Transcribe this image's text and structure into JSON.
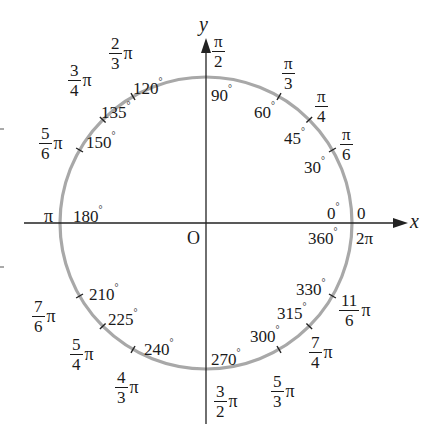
{
  "diagram": {
    "axes": {
      "x_label": "x",
      "y_label": "y",
      "origin_label": "O"
    },
    "colors": {
      "circle": "#a8a8a8",
      "axis": "#222222",
      "text": "#1a1a1a",
      "background": "#ffffff"
    },
    "points": [
      {
        "deg": 0,
        "deg_label": "0",
        "rad_label": "0"
      },
      {
        "deg": 30,
        "deg_label": "30",
        "rad_num": "π",
        "rad_den": "6"
      },
      {
        "deg": 45,
        "deg_label": "45",
        "rad_num": "π",
        "rad_den": "4"
      },
      {
        "deg": 60,
        "deg_label": "60",
        "rad_num": "π",
        "rad_den": "3"
      },
      {
        "deg": 90,
        "deg_label": "90",
        "rad_num": "π",
        "rad_den": "2"
      },
      {
        "deg": 120,
        "deg_label": "120",
        "rad_num": "2",
        "rad_den": "3",
        "rad_suffix": "π"
      },
      {
        "deg": 135,
        "deg_label": "135",
        "rad_num": "3",
        "rad_den": "4",
        "rad_suffix": "π"
      },
      {
        "deg": 150,
        "deg_label": "150",
        "rad_num": "5",
        "rad_den": "6",
        "rad_suffix": "π"
      },
      {
        "deg": 180,
        "deg_label": "180",
        "rad_label": "π"
      },
      {
        "deg": 210,
        "deg_label": "210",
        "rad_num": "7",
        "rad_den": "6",
        "rad_suffix": "π"
      },
      {
        "deg": 225,
        "deg_label": "225",
        "rad_num": "5",
        "rad_den": "4",
        "rad_suffix": "π"
      },
      {
        "deg": 240,
        "deg_label": "240",
        "rad_num": "4",
        "rad_den": "3",
        "rad_suffix": "π"
      },
      {
        "deg": 270,
        "deg_label": "270",
        "rad_num": "3",
        "rad_den": "2",
        "rad_suffix": "π"
      },
      {
        "deg": 300,
        "deg_label": "300",
        "rad_num": "5",
        "rad_den": "3",
        "rad_suffix": "π"
      },
      {
        "deg": 315,
        "deg_label": "315",
        "rad_num": "7",
        "rad_den": "4",
        "rad_suffix": "π"
      },
      {
        "deg": 330,
        "deg_label": "330",
        "rad_num": "11",
        "rad_den": "6",
        "rad_suffix": "π"
      },
      {
        "deg": 360,
        "deg_label": "360",
        "rad_label": "2π"
      }
    ],
    "degree_symbol": "°",
    "pi_symbol": "π"
  }
}
